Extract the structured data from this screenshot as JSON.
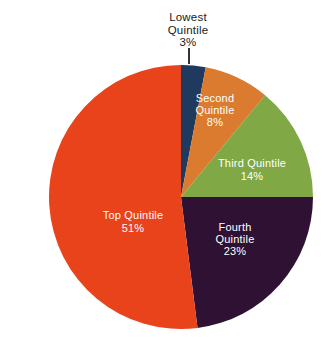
{
  "chart_data": {
    "type": "pie",
    "title": "",
    "start_angle_deg": 0,
    "direction": "clockwise",
    "unit": "%",
    "categories": [
      "Lowest Quintile",
      "Second Quintile",
      "Third Quintile",
      "Fourth Quintile",
      "Top Quintile"
    ],
    "values": [
      3,
      8,
      14,
      23,
      51
    ],
    "slices": [
      {
        "name": "Lowest Quintile",
        "value": 3,
        "display_value": "3%",
        "color": "#1f3a5e",
        "label_color": "#1a1a1a",
        "label_position": "outside-top",
        "label_lines": [
          "Lowest",
          "Quintile",
          "3%"
        ]
      },
      {
        "name": "Second Quintile",
        "value": 8,
        "display_value": "8%",
        "color": "#db7b2f",
        "label_color": "#ffffff",
        "label_position": "inside",
        "label_lines": [
          "Second",
          "Quintile",
          "8%"
        ]
      },
      {
        "name": "Third Quintile",
        "value": 14,
        "display_value": "14%",
        "color": "#80a845",
        "label_color": "#ffffff",
        "label_position": "inside",
        "label_lines": [
          "Third Quintile",
          "14%"
        ]
      },
      {
        "name": "Fourth Quintile",
        "value": 23,
        "display_value": "23%",
        "color": "#2e1133",
        "label_color": "#ffffff",
        "label_position": "inside",
        "label_lines": [
          "Fourth",
          "Quintile",
          "23%"
        ]
      },
      {
        "name": "Top Quintile",
        "value": 51,
        "display_value": "51%",
        "color": "#e9431b",
        "label_color": "#ffffff",
        "label_position": "inside",
        "label_lines": [
          "Top Quintile",
          "51%"
        ]
      }
    ],
    "geometry": {
      "center_x": 181,
      "center_y": 197,
      "radius": 132
    },
    "legend": "none",
    "labels_on_slices": true
  }
}
